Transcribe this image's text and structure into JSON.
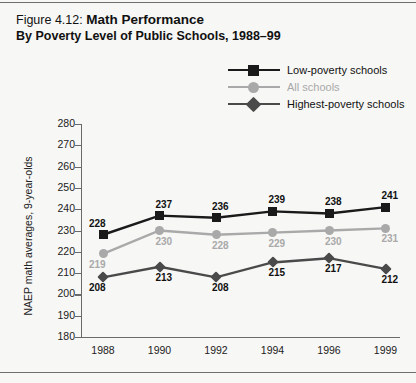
{
  "figure": {
    "label": "Figure 4.12:",
    "title": "Math Performance",
    "subtitle": "By Poverty Level of Public Schools, 1988–99"
  },
  "colors": {
    "low_poverty": "#1a1a1a",
    "all_schools": "#a9a9a9",
    "highest_poverty": "#4a4a4a",
    "axis": "#6a6a6a",
    "background": "#f7f7f5",
    "text": "#111111"
  },
  "chart_data": {
    "type": "line",
    "title": "Math Performance",
    "subtitle": "By Poverty Level of Public Schools, 1988–99",
    "xlabel": "",
    "ylabel": "NAEP math averages, 9-year-olds",
    "categories": [
      "1988",
      "1990",
      "1992",
      "1994",
      "1996",
      "1999"
    ],
    "ylim": [
      180,
      280
    ],
    "ytick_step": 10,
    "yticks": [
      "280",
      "270",
      "260",
      "250",
      "240",
      "230",
      "220",
      "210",
      "200",
      "190",
      "180"
    ],
    "grid": false,
    "legend_position": "top-right",
    "series": [
      {
        "name": "Low-poverty schools",
        "marker": "square",
        "color": "#1a1a1a",
        "label_color": "#111111",
        "values": [
          228,
          237,
          236,
          239,
          238,
          241
        ],
        "labels": [
          "228",
          "237",
          "236",
          "239",
          "238",
          "241"
        ]
      },
      {
        "name": "All schools",
        "marker": "circle",
        "color": "#a9a9a9",
        "label_color": "#a9a9a9",
        "values": [
          219,
          230,
          228,
          229,
          230,
          231
        ],
        "labels": [
          "219",
          "230",
          "228",
          "229",
          "230",
          "231"
        ]
      },
      {
        "name": "Highest-poverty schools",
        "marker": "diamond",
        "color": "#4a4a4a",
        "label_color": "#111111",
        "values": [
          208,
          213,
          208,
          215,
          217,
          212
        ],
        "labels": [
          "208",
          "213",
          "208",
          "215",
          "217",
          "212"
        ]
      }
    ]
  }
}
